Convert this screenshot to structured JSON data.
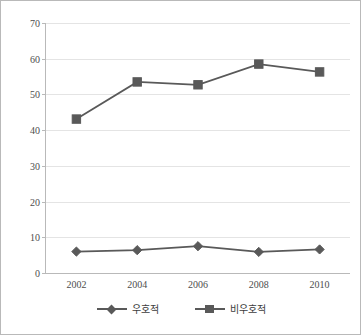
{
  "chart_data": {
    "type": "line",
    "title": "",
    "xlabel": "",
    "ylabel": "",
    "categories": [
      "2002",
      "2004",
      "2006",
      "2008",
      "2010"
    ],
    "ylim": [
      0,
      70
    ],
    "yticks": [
      0,
      10,
      20,
      30,
      40,
      50,
      60,
      70
    ],
    "grid": true,
    "legend_position": "bottom",
    "series": [
      {
        "name": "우호적",
        "marker": "diamond",
        "color": "#595959",
        "values": [
          6.0,
          6.4,
          7.5,
          5.9,
          6.6
        ]
      },
      {
        "name": "비우호적",
        "marker": "square",
        "color": "#595959",
        "values": [
          43.1,
          53.5,
          52.7,
          58.5,
          56.3
        ]
      }
    ]
  },
  "colors": {
    "line": "#595959",
    "grid": "#e4e4e4",
    "axis": "#b9b9b9",
    "tick_text": "#4d4d4d",
    "border": "#b9b9b9"
  }
}
